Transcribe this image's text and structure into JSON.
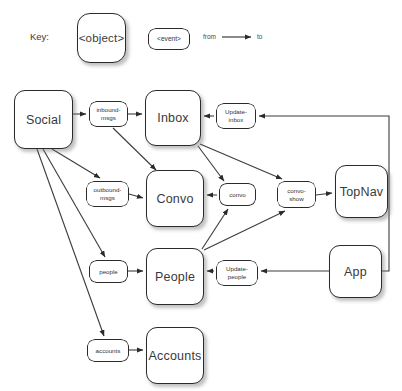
{
  "diagram": {
    "title_legend": "Key:",
    "legend": {
      "key_word": "Key:",
      "object_sample": "<object>",
      "event_sample": "<event>",
      "from_word": "from",
      "to_word": "to",
      "arrow_glyph": "arrow-right"
    },
    "objects": [
      {
        "id": "social",
        "label": "Social",
        "x": 14,
        "y": 90,
        "w": 59,
        "h": 59
      },
      {
        "id": "inbox",
        "label": "Inbox",
        "x": 145,
        "y": 90,
        "w": 56,
        "h": 56
      },
      {
        "id": "convo",
        "label": "Convo",
        "x": 146,
        "y": 170,
        "w": 58,
        "h": 57
      },
      {
        "id": "people",
        "label": "People",
        "x": 146,
        "y": 248,
        "w": 58,
        "h": 57
      },
      {
        "id": "accounts",
        "label": "Accounts",
        "x": 146,
        "y": 327,
        "w": 58,
        "h": 57
      },
      {
        "id": "topnav",
        "label": "TopNav",
        "x": 335,
        "y": 165,
        "w": 53,
        "h": 53
      },
      {
        "id": "app",
        "label": "App",
        "x": 329,
        "y": 245,
        "w": 53,
        "h": 53
      }
    ],
    "events": [
      {
        "id": "inbound-msgs",
        "label": "inbound-\nmsgs",
        "x": 89,
        "y": 101,
        "w": 39,
        "h": 26
      },
      {
        "id": "outbound-msgs",
        "label": "outbound-\nmsgs",
        "x": 86,
        "y": 181,
        "w": 43,
        "h": 26
      },
      {
        "id": "people-ev",
        "label": "people",
        "x": 89,
        "y": 260,
        "w": 39,
        "h": 23
      },
      {
        "id": "accounts-ev",
        "label": "accounts",
        "x": 87,
        "y": 339,
        "w": 42,
        "h": 23
      },
      {
        "id": "update-inbox",
        "label": "Update-\ninbox",
        "x": 216,
        "y": 103,
        "w": 40,
        "h": 26
      },
      {
        "id": "convo-ev",
        "label": "convo",
        "x": 219,
        "y": 183,
        "w": 37,
        "h": 23
      },
      {
        "id": "convo-show",
        "label": "convo-\nshow",
        "x": 277,
        "y": 181,
        "w": 39,
        "h": 27
      },
      {
        "id": "update-people",
        "label": "Update-\npeople",
        "x": 216,
        "y": 260,
        "w": 42,
        "h": 26
      }
    ],
    "edges": [
      {
        "from": "social",
        "to": "inbound-msgs"
      },
      {
        "from": "inbound-msgs",
        "to": "inbox"
      },
      {
        "from": "inbound-msgs",
        "to": "convo"
      },
      {
        "from": "social",
        "to": "outbound-msgs"
      },
      {
        "from": "social",
        "to": "people-ev"
      },
      {
        "from": "social",
        "to": "accounts-ev"
      },
      {
        "from": "outbound-msgs",
        "to": "convo"
      },
      {
        "from": "people-ev",
        "to": "people"
      },
      {
        "from": "accounts-ev",
        "to": "accounts"
      },
      {
        "from": "update-inbox",
        "to": "inbox"
      },
      {
        "from": "app",
        "to": "update-inbox"
      },
      {
        "from": "inbox",
        "to": "convo-ev"
      },
      {
        "from": "inbox",
        "to": "convo-show"
      },
      {
        "from": "people",
        "to": "convo-ev"
      },
      {
        "from": "people",
        "to": "convo-show"
      },
      {
        "from": "convo-ev",
        "to": "convo"
      },
      {
        "from": "convo-show",
        "to": "topnav"
      },
      {
        "from": "app",
        "to": "update-people"
      },
      {
        "from": "update-people",
        "to": "people"
      }
    ],
    "colors": {
      "stroke": "#2b2b2b",
      "wire": "#3c3c3c",
      "text": "#3a3a3a",
      "background": "#ffffff"
    }
  }
}
